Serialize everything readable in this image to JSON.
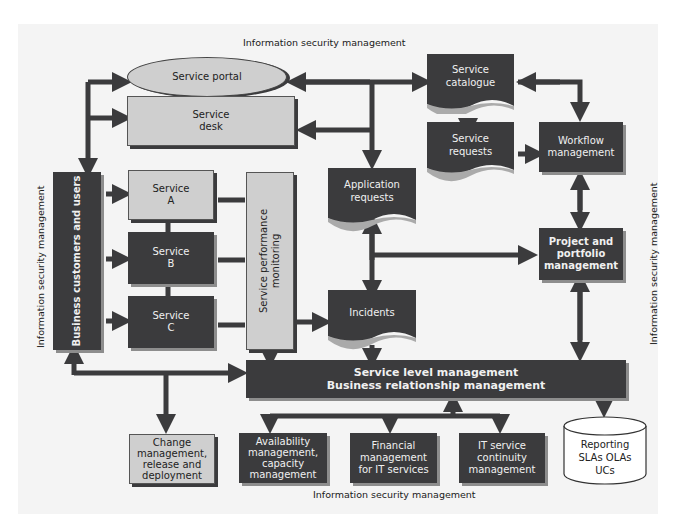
{
  "title": "Information security management",
  "labels": {
    "top": "Information security management",
    "bottom": "Information security management",
    "left": "Information security management",
    "right": "Information security management"
  },
  "nodes": {
    "service_portal": "Service portal",
    "service_desk": [
      "Service",
      "desk"
    ],
    "service_catalogue": [
      "Service",
      "catalogue"
    ],
    "service_requests": [
      "Service",
      "requests"
    ],
    "workflow_management": [
      "Workflow",
      "management"
    ],
    "business_customers": "Business customers and users",
    "service_a": [
      "Service",
      "A"
    ],
    "service_b": [
      "Service",
      "B"
    ],
    "service_c": [
      "Service",
      "C"
    ],
    "service_performance_monitoring": [
      "Service performance",
      "monitoring"
    ],
    "application_requests": [
      "Application",
      "requests"
    ],
    "project_portfolio": [
      "Project and",
      "portfolio",
      "management"
    ],
    "incidents": "Incidents",
    "service_level_management": [
      "Service level management",
      "Business relationship management"
    ],
    "change_management": [
      "Change",
      "management,",
      "release and",
      "deployment"
    ],
    "availability_management": [
      "Availability",
      "management,",
      "capacity",
      "management"
    ],
    "financial_management": [
      "Financial",
      "management",
      "for IT services"
    ],
    "it_service_continuity": [
      "IT service",
      "continuity",
      "management"
    ],
    "reporting": [
      "Reporting",
      "SLAs OLAs",
      "UCs"
    ]
  },
  "colors": {
    "dark_box": "#3b3b3d",
    "light_box": "#cfcfcf",
    "arrow": "#3b3b3d",
    "background": "#f4f4f4"
  }
}
